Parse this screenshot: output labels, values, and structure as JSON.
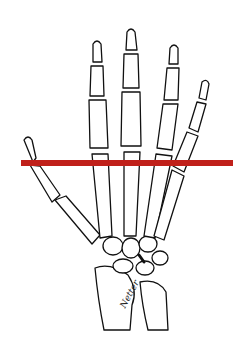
{
  "image": {
    "subject": "skeletal hand and wrist line drawing (dorsal view)",
    "signature": "Netter",
    "marker_line": {
      "color": "#c0201a",
      "x1": 21,
      "x2": 233,
      "y": 163,
      "thickness": 6
    }
  }
}
